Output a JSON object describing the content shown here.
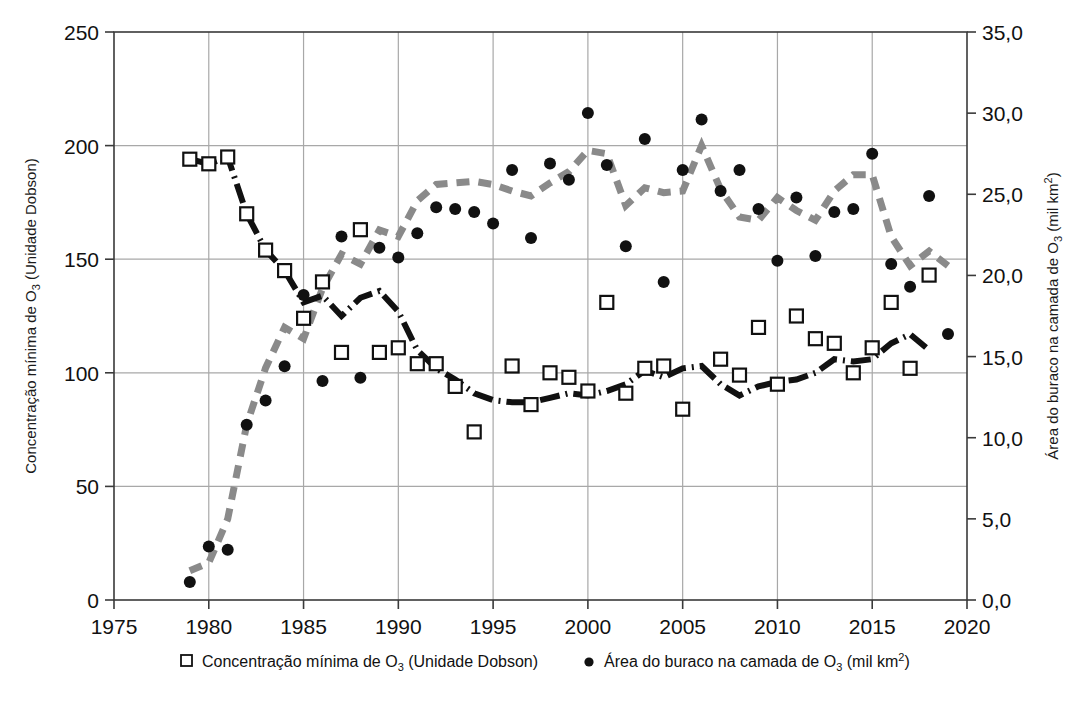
{
  "chart_data": {
    "type": "scatter",
    "title": "",
    "xlabel": "",
    "x": [
      1979,
      1980,
      1981,
      1982,
      1983,
      1984,
      1985,
      1986,
      1987,
      1988,
      1989,
      1990,
      1991,
      1992,
      1993,
      1994,
      1995,
      1996,
      1997,
      1998,
      1999,
      2000,
      2001,
      2002,
      2003,
      2004,
      2005,
      2006,
      2007,
      2008,
      2009,
      2010,
      2011,
      2012,
      2013,
      2014,
      2015,
      2016,
      2017,
      2018,
      2019
    ],
    "xlim": [
      1975,
      2020
    ],
    "xticks": [
      1975,
      1980,
      1985,
      1990,
      1995,
      2000,
      2005,
      2010,
      2015,
      2020
    ],
    "xticklabels": [
      "1975",
      "1980",
      "1985",
      "1990",
      "1995",
      "2000",
      "2005",
      "2010",
      "2015",
      "2020"
    ],
    "grid": true,
    "legend_position": "bottom",
    "left_axis": {
      "label": "Concentração mínima de O3 (Unidade Dobson)",
      "label_parts": {
        "pre": "Concentração mínima de O",
        "sub": "3",
        "post": " (Unidade Dobson)"
      },
      "ylim": [
        0,
        250
      ],
      "yticks": [
        0,
        50,
        100,
        150,
        200,
        250
      ],
      "yticklabels": [
        "0",
        "50",
        "100",
        "150",
        "200",
        "250"
      ]
    },
    "right_axis": {
      "label": "Área do buraco na camada de O3 (mil km2)",
      "label_parts": {
        "pre": "Área do buraco na camada de O",
        "sub": "3",
        "mid": " (mil km",
        "sup": "2",
        "post": ")"
      },
      "ylim": [
        0,
        35
      ],
      "yticks": [
        0,
        5,
        10,
        15,
        20,
        25,
        30,
        35
      ],
      "yticklabels": [
        "0,0",
        "5,0",
        "10,0",
        "15,0",
        "20,0",
        "25,0",
        "30,0",
        "35,0"
      ]
    },
    "series": [
      {
        "name": "Concentração mínima de O3 (Unidade Dobson)",
        "name_parts": {
          "pre": "Concentração mínima de O",
          "sub": "3",
          "post": " (Unidade Dobson)"
        },
        "axis": "left",
        "marker": "open-square",
        "line_style": "dash-dot",
        "color": "#111111",
        "values": [
          194,
          192,
          195,
          170,
          154,
          145,
          124,
          140,
          109,
          163,
          109,
          111,
          104,
          104,
          94,
          74,
          null,
          103,
          86,
          100,
          98,
          92,
          131,
          91,
          102,
          103,
          84,
          null,
          106,
          99,
          120,
          95,
          125,
          115,
          113,
          100,
          111,
          131,
          102,
          143,
          null
        ],
        "trend": [
          194,
          192,
          195,
          170,
          154,
          145,
          131,
          134,
          125,
          133,
          136,
          127,
          110,
          102,
          97,
          91,
          88,
          87,
          87,
          89,
          91,
          90,
          92,
          95,
          101,
          98,
          102,
          103,
          95,
          90,
          94,
          96,
          97,
          100,
          106,
          105,
          106,
          113,
          117,
          110,
          null
        ]
      },
      {
        "name": "Área do buraco na camada de O3 (mil km2)",
        "name_parts": {
          "pre": "Área do buraco na camada de O",
          "sub": "3",
          "mid": " (mil km",
          "sup": "2",
          "post": ")"
        },
        "axis": "right",
        "marker": "filled-circle",
        "line_style": "dashed",
        "color": "#888888",
        "values": [
          1.1,
          3.3,
          3.1,
          10.8,
          12.3,
          14.4,
          18.8,
          13.5,
          22.4,
          13.7,
          21.7,
          21.1,
          22.6,
          24.2,
          24.1,
          23.9,
          23.2,
          26.5,
          22.3,
          26.9,
          25.9,
          30.0,
          26.8,
          21.8,
          28.4,
          19.6,
          26.5,
          29.6,
          25.2,
          26.5,
          24.1,
          20.9,
          24.8,
          21.2,
          23.9,
          24.1,
          27.5,
          20.7,
          19.3,
          24.9,
          16.4
        ],
        "trend": [
          1.8,
          2.3,
          5.0,
          10.8,
          14.3,
          16.8,
          16.1,
          19.2,
          21.3,
          20.7,
          22.8,
          22.4,
          24.6,
          25.6,
          25.7,
          25.8,
          25.6,
          25.2,
          24.9,
          25.7,
          26.4,
          27.7,
          27.5,
          24.3,
          25.4,
          25.1,
          25.2,
          28.0,
          25.3,
          23.6,
          23.4,
          24.8,
          24.0,
          23.4,
          25.2,
          26.2,
          26.2,
          22.4,
          20.6,
          21.5,
          20.6
        ]
      }
    ]
  },
  "legend": {
    "items": [
      {
        "marker": "open-square",
        "label": "Concentração mínima de O3 (Unidade Dobson)"
      },
      {
        "marker": "filled-circle",
        "label": "Área do buraco na camada de O3 (mil km2)"
      }
    ]
  },
  "colors": {
    "axis": "#3a3a3a",
    "grid": "#a8a8a8",
    "series_dobson": "#111111",
    "series_area": "#8a8a8a",
    "background": "#ffffff"
  }
}
